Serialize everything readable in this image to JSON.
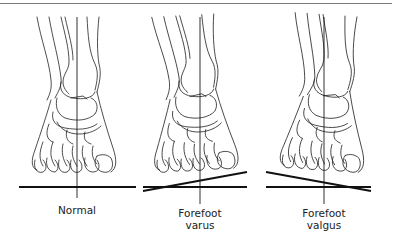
{
  "figure": {
    "panels": [
      {
        "id": "normal",
        "label_lines": [
          "Normal"
        ],
        "axis_x": 77,
        "condition": "normal"
      },
      {
        "id": "forefoot-varus",
        "label_lines": [
          "Forefoot",
          "varus"
        ],
        "axis_x": 200,
        "condition": "varus"
      },
      {
        "id": "forefoot-valgus",
        "label_lines": [
          "Forefoot",
          "valgus"
        ],
        "axis_x": 324,
        "condition": "valgus"
      }
    ],
    "line_color": "#1a1a1a"
  },
  "labels": {
    "normal": "Normal",
    "varus_line1": "Forefoot",
    "varus_line2": "varus",
    "valgus_line1": "Forefoot",
    "valgus_line2": "valgus"
  }
}
